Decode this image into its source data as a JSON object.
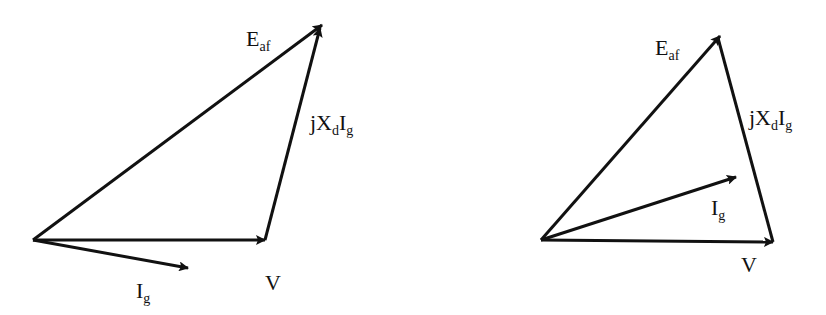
{
  "diagrams": [
    {
      "name": "phasor-diagram-lagging",
      "origin": [
        33,
        240
      ],
      "vectors": {
        "V": {
          "tip": [
            265,
            240
          ],
          "label": {
            "main": "V",
            "sub": "",
            "pos": [
              265,
              290
            ]
          }
        },
        "E_af": {
          "tip": [
            322,
            25
          ],
          "label": {
            "main": "E",
            "sub": "af",
            "pos": [
              246,
              46
            ]
          }
        },
        "jXdIg": {
          "from": [
            265,
            240
          ],
          "tip": [
            322,
            25
          ],
          "label": {
            "main": "jX",
            "sub": "d",
            "main2": "I",
            "sub2": "g",
            "pos": [
              310,
              130
            ]
          }
        },
        "I_g": {
          "tip": [
            188,
            268
          ],
          "label": {
            "main": "I",
            "sub": "g",
            "pos": [
              136,
              298
            ]
          }
        }
      }
    },
    {
      "name": "phasor-diagram-leading",
      "origin": [
        541,
        240
      ],
      "vectors": {
        "V": {
          "tip": [
            773,
            242
          ],
          "label": {
            "main": "V",
            "sub": "",
            "pos": [
              741,
              272
            ]
          }
        },
        "E_af": {
          "tip": [
            718,
            36
          ],
          "label": {
            "main": "E",
            "sub": "af",
            "pos": [
              655,
              55
            ]
          }
        },
        "jXdIg": {
          "from": [
            773,
            242
          ],
          "tip": [
            718,
            36
          ],
          "label": {
            "main": "jX",
            "sub": "d",
            "main2": "I",
            "sub2": "g",
            "pos": [
              749,
              125
            ]
          }
        },
        "I_g": {
          "tip": [
            736,
            177
          ],
          "label": {
            "main": "I",
            "sub": "g",
            "pos": [
              711,
              215
            ]
          }
        }
      }
    }
  ],
  "labels": {
    "E": "E",
    "af": "af",
    "jX": "jX",
    "d": "d",
    "I": "I",
    "g": "g",
    "V": "V"
  },
  "colors": {
    "stroke": "#111111",
    "background": "#ffffff"
  }
}
